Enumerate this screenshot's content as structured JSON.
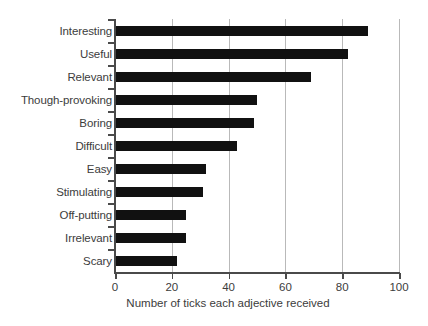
{
  "chart_data": {
    "type": "bar",
    "orientation": "horizontal",
    "title": "",
    "xlabel": "Number of ticks each adjective received",
    "ylabel": "",
    "xlim": [
      0,
      100
    ],
    "xticks": [
      0,
      20,
      40,
      60,
      80,
      100
    ],
    "xtick_labels": [
      "0",
      "20",
      "40",
      "60",
      "80",
      "100"
    ],
    "grid": "vertical",
    "legend": "none",
    "bar_color": "#111111",
    "grid_color": "#b9b9b9",
    "axis_color": "#4a4a4a",
    "text_color": "#3c3c3c",
    "categories": [
      "Interesting",
      "Useful",
      "Relevant",
      "Though-provoking",
      "Boring",
      "Difficult",
      "Easy",
      "Stimulating",
      "Off-putting",
      "Irrelevant",
      "Scary"
    ],
    "values": [
      89,
      82,
      69,
      50,
      49,
      43,
      32,
      31,
      25,
      25,
      22
    ]
  }
}
